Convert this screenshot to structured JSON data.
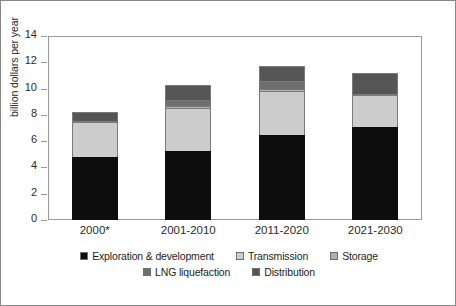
{
  "chart_data": {
    "type": "bar",
    "subtype": "stacked-vertical",
    "title": "",
    "xlabel": "",
    "ylabel": "billion dollars per year",
    "categories": [
      "2000*",
      "2001-2010",
      "2011-2020",
      "2021-2030"
    ],
    "ylim": [
      0,
      14
    ],
    "yticks": [
      0,
      2,
      4,
      6,
      8,
      10,
      12,
      14
    ],
    "ytick_labels": [
      "0",
      "2",
      "4",
      "6",
      "8",
      "10",
      "12",
      "14"
    ],
    "grid": false,
    "legend_position": "bottom",
    "series": [
      {
        "name": "Exploration & development",
        "color": "#0d0d0d",
        "values": [
          4.8,
          5.25,
          6.5,
          7.1
        ]
      },
      {
        "name": "Transmission",
        "color": "#cccccc",
        "values": [
          2.65,
          3.25,
          3.3,
          2.4
        ]
      },
      {
        "name": "Storage",
        "color": "#b0b0b0",
        "values": [
          0.1,
          0.18,
          0.2,
          0.1
        ]
      },
      {
        "name": "LNG liquefaction",
        "color": "#6e6e6e",
        "values": [
          0.0,
          0.45,
          0.55,
          0.0
        ]
      },
      {
        "name": "Distribution",
        "color": "#555555",
        "values": [
          0.65,
          1.17,
          1.2,
          1.55
        ]
      }
    ],
    "bar_totals": [
      8.2,
      10.3,
      11.75,
      11.15
    ],
    "footnote_marker": "*"
  },
  "axes": {
    "y_title": "billion dollars per year",
    "y_labels": [
      "14",
      "12",
      "10",
      "8",
      "6",
      "4",
      "2",
      "0"
    ],
    "x_labels": [
      "2000*",
      "2001-2010",
      "2011-2020",
      "2021-2030"
    ]
  },
  "legend": {
    "row1": [
      {
        "label": "Exploration & development",
        "color": "#0d0d0d"
      },
      {
        "label": "Transmission",
        "color": "#cccccc"
      },
      {
        "label": "Storage",
        "color": "#b0b0b0"
      }
    ],
    "row2": [
      {
        "label": "LNG liquefaction",
        "color": "#6e6e6e"
      },
      {
        "label": "Distribution",
        "color": "#555555"
      }
    ]
  }
}
